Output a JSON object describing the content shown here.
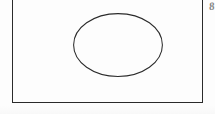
{
  "page": {
    "width": 215,
    "height": 114,
    "background_color": "#ffffff",
    "surface_color": "#fdfdfd"
  },
  "figure": {
    "frame": {
      "name": "rectangle-border",
      "stroke_color": "#2b2b2b",
      "stroke_width": 1,
      "left": 12,
      "right": 203,
      "bottom": 103,
      "top_edge_visible": false
    },
    "ellipse": {
      "name": "ellipse-outline",
      "stroke_color": "#2b2b2b",
      "stroke_width": 1,
      "fill": "none",
      "center_x": 105,
      "center_y": 51,
      "radius_x": 45,
      "radius_y": 32
    }
  },
  "annotations": {
    "corner_mark": {
      "label": "8",
      "color": "#6d6d6d",
      "position": "top-right-outside-frame"
    }
  }
}
